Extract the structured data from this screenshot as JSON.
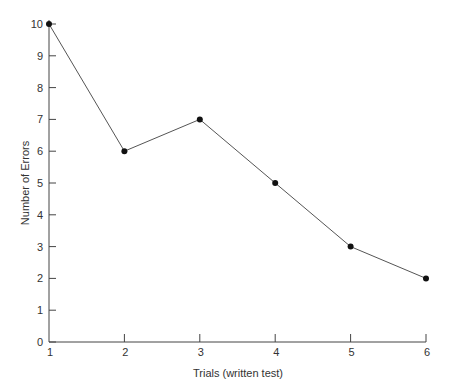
{
  "chart_data": {
    "type": "line",
    "title": "",
    "xlabel": "Trials (written test)",
    "ylabel": "Number of Errors",
    "categories": [
      "1",
      "2",
      "3",
      "4",
      "5",
      "6"
    ],
    "x": [
      1,
      2,
      3,
      4,
      5,
      6
    ],
    "values": [
      10,
      6,
      7,
      5,
      3,
      2
    ],
    "series": [
      {
        "name": "Errors",
        "values": [
          10,
          6,
          7,
          5,
          3,
          2
        ]
      }
    ],
    "xlim": [
      1,
      6
    ],
    "ylim": [
      0,
      10
    ],
    "yticks": [
      0,
      1,
      2,
      3,
      4,
      5,
      6,
      7,
      8,
      9,
      10
    ],
    "xticks": [
      1,
      2,
      3,
      4,
      5,
      6
    ],
    "grid": false,
    "legend": "none",
    "markers": "filled-circle"
  },
  "colors": {
    "line": "#555555",
    "marker": "#111111",
    "axis": "#444444",
    "text": "#333333"
  }
}
